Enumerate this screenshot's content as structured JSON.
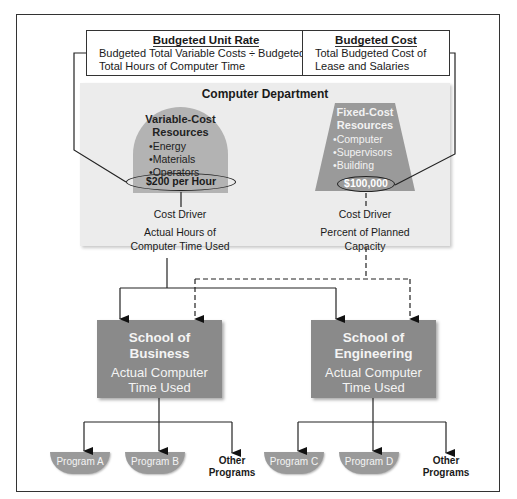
{
  "budgeted_unit_rate": {
    "title": "Budgeted Unit Rate",
    "text": "Budgeted Total Variable Costs ÷ Budgeted Total Hours of Computer Time"
  },
  "budgeted_cost": {
    "title": "Budgeted Cost",
    "text": "Total Budgeted Cost of Lease and Salaries"
  },
  "department": {
    "title": "Computer Department",
    "variable": {
      "title_line1": "Variable-Cost",
      "title_line2": "Resources",
      "items": [
        "Energy",
        "Materials",
        "Operators"
      ],
      "rate": "$200 per Hour",
      "driver_label": "Cost Driver",
      "driver_line1": "Actual Hours of",
      "driver_line2": "Computer Time Used"
    },
    "fixed": {
      "title_line1": "Fixed-Cost",
      "title_line2": "Resources",
      "items": [
        "Computer",
        "Supervisors",
        "Building"
      ],
      "amount": "$100,000",
      "driver_label": "Cost Driver",
      "driver_text": "Percent of Planned Capacity"
    }
  },
  "schools": [
    {
      "name_line1": "School of",
      "name_line2": "Business",
      "usage_line1": "Actual Computer",
      "usage_line2": "Time Used",
      "programs": [
        "Program A",
        "Program B"
      ],
      "other_line1": "Other",
      "other_line2": "Programs"
    },
    {
      "name_line1": "School of",
      "name_line2": "Engineering",
      "usage_line1": "Actual Computer",
      "usage_line2": "Time Used",
      "programs": [
        "Program C",
        "Program D"
      ],
      "other_line1": "Other",
      "other_line2": "Programs"
    }
  ],
  "colors": {
    "department_bg": "#ececec",
    "variable_shape": "#b3b3b3",
    "fixed_shape": "#9a9a9a",
    "school_box": "#8a8a8a",
    "program_shape": "#9a9a9a"
  }
}
